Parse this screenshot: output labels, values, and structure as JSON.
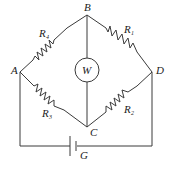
{
  "diagram": {
    "type": "circuit",
    "nodes": {
      "A": {
        "label": "A"
      },
      "B": {
        "label": "B"
      },
      "C": {
        "label": "C"
      },
      "D": {
        "label": "D"
      }
    },
    "resistors": [
      {
        "id": "R4",
        "label": "R",
        "subscript": "4",
        "between": [
          "A",
          "B"
        ]
      },
      {
        "id": "R1",
        "label": "R",
        "subscript": "1",
        "between": [
          "B",
          "D"
        ]
      },
      {
        "id": "R3",
        "label": "R",
        "subscript": "3",
        "between": [
          "A",
          "C"
        ]
      },
      {
        "id": "R2",
        "label": "R",
        "subscript": "2",
        "between": [
          "C",
          "D"
        ]
      }
    ],
    "meter": {
      "label": "W",
      "between": [
        "B",
        "C"
      ]
    },
    "source": {
      "label": "G",
      "type": "battery",
      "between": [
        "A",
        "D"
      ]
    },
    "colors": {
      "line": "#3a3a3a",
      "text": "#222222",
      "background": "#ffffff"
    }
  }
}
